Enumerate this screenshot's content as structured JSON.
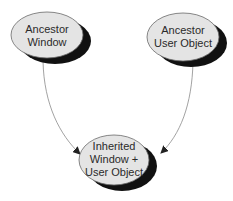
{
  "diagram": {
    "nodes": [
      {
        "id": "ancestor-window",
        "lines": [
          "Ancestor",
          "Window"
        ]
      },
      {
        "id": "ancestor-user-object",
        "lines": [
          "Ancestor",
          "User Object"
        ]
      },
      {
        "id": "inherited",
        "lines": [
          "Inherited",
          "Window +",
          "User Object"
        ]
      }
    ],
    "edges": [
      {
        "from": "ancestor-window",
        "to": "inherited"
      },
      {
        "from": "ancestor-user-object",
        "to": "inherited"
      }
    ],
    "colors": {
      "node_fill": "#e4e4e4",
      "node_stroke": "#6a6a6a",
      "shadow": "#111111",
      "edge": "#8a8a8a",
      "arrowhead": "#222222"
    }
  }
}
